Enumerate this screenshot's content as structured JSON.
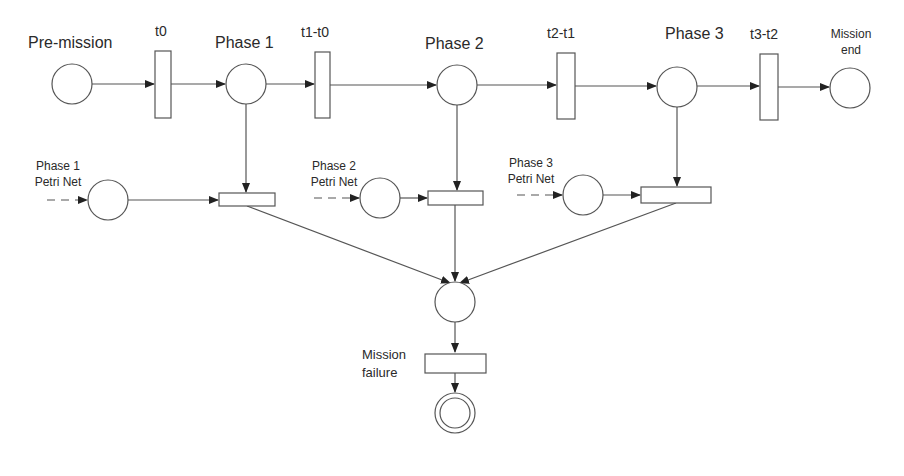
{
  "diagram": {
    "type": "phased-mission-petri-net",
    "top_row": {
      "places": [
        {
          "id": "pre-mission",
          "label": "Pre-mission"
        },
        {
          "id": "phase-1",
          "label": "Phase 1"
        },
        {
          "id": "phase-2",
          "label": "Phase 2"
        },
        {
          "id": "phase-3",
          "label": "Phase 3"
        },
        {
          "id": "mission-end",
          "label_line1": "Mission",
          "label_line2": "end"
        }
      ],
      "transitions": [
        {
          "id": "t0",
          "label": "t0"
        },
        {
          "id": "t1-t0",
          "label": "t1-t0"
        },
        {
          "id": "t2-t1",
          "label": "t2-t1"
        },
        {
          "id": "t3-t2",
          "label": "t3-t2"
        }
      ]
    },
    "sub_nets": [
      {
        "id": "phase-1-petri-net",
        "label_line1": "Phase 1",
        "label_line2": "Petri Net"
      },
      {
        "id": "phase-2-petri-net",
        "label_line1": "Phase 2",
        "label_line2": "Petri Net"
      },
      {
        "id": "phase-3-petri-net",
        "label_line1": "Phase 3",
        "label_line2": "Petri Net"
      }
    ],
    "failure": {
      "transition_label_line1": "Mission",
      "transition_label_line2": "failure"
    }
  }
}
